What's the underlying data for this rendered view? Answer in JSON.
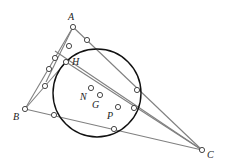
{
  "diagram": {
    "type": "geometry",
    "colors": {
      "segment": "#808080",
      "circle": "#111111",
      "point_stroke": "#333333",
      "point_fill": "#ffffff",
      "label": "#222222"
    },
    "labels": {
      "A": "A",
      "B": "B",
      "C": "C",
      "H": "H",
      "N": "N",
      "G": "G",
      "P": "P"
    },
    "vertices": {
      "A": [
        73,
        27
      ],
      "B": [
        25,
        109
      ],
      "C": [
        202,
        150
      ],
      "H": [
        66,
        62
      ]
    },
    "centers": {
      "N": [
        91,
        88
      ],
      "G": [
        100,
        95
      ],
      "P": [
        118,
        107
      ]
    },
    "circle": {
      "cx": 97,
      "cy": 93,
      "r": 44
    }
  }
}
